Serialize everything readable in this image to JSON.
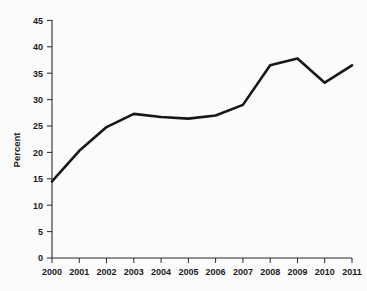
{
  "chart_data": {
    "type": "line",
    "title": "",
    "subtitle": "",
    "xlabel": "",
    "ylabel": "Percent",
    "categories": [
      "2000",
      "2001",
      "2002",
      "2003",
      "2004",
      "2005",
      "2006",
      "2007",
      "2008",
      "2009",
      "2010",
      "2011"
    ],
    "x": [
      2000,
      2001,
      2002,
      2003,
      2004,
      2005,
      2006,
      2007,
      2008,
      2009,
      2010,
      2011
    ],
    "values": [
      14.5,
      20.3,
      24.8,
      27.3,
      26.7,
      26.4,
      27.0,
      29.0,
      36.5,
      37.8,
      33.2,
      36.5
    ],
    "series": [
      {
        "name": "Percent",
        "color": "#171717",
        "values": [
          14.5,
          20.3,
          24.8,
          27.3,
          26.7,
          26.4,
          27.0,
          29.0,
          36.5,
          37.8,
          33.2,
          36.5
        ]
      }
    ],
    "ylim": [
      0,
      45
    ],
    "xlim": [
      2000,
      2011
    ],
    "yticks": [
      0,
      5,
      10,
      15,
      20,
      25,
      30,
      35,
      40,
      45
    ],
    "ytick_labels": [
      "0",
      "5",
      "10",
      "15",
      "20",
      "25",
      "30",
      "35",
      "40",
      "45"
    ],
    "xtick_labels": [
      "2000",
      "2001",
      "2002",
      "2003",
      "2004",
      "2005",
      "2006",
      "2007",
      "2008",
      "2009",
      "2010",
      "2011"
    ],
    "grid": false,
    "legend": false,
    "legend_position": "none",
    "markers": false,
    "annotations": [],
    "background_color": "#fbfbfb",
    "axis_color": "#2b2b2b"
  }
}
